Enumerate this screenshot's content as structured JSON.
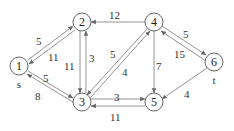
{
  "diagram": {
    "type": "directed-weighted-graph",
    "nodes": [
      {
        "id": "1",
        "label": "1",
        "sublabel": "s",
        "x": 19,
        "y": 66
      },
      {
        "id": "2",
        "label": "2",
        "x": 82,
        "y": 22
      },
      {
        "id": "3",
        "label": "3",
        "x": 82,
        "y": 102
      },
      {
        "id": "4",
        "label": "4",
        "x": 154,
        "y": 22
      },
      {
        "id": "5",
        "label": "5",
        "x": 154,
        "y": 102
      },
      {
        "id": "6",
        "label": "6",
        "sublabel": "t",
        "x": 214,
        "y": 62
      }
    ],
    "edges": [
      {
        "from": "1",
        "to": "2",
        "weight": "5"
      },
      {
        "from": "2",
        "to": "1",
        "weight": "11"
      },
      {
        "from": "1",
        "to": "3",
        "weight": "5"
      },
      {
        "from": "3",
        "to": "1",
        "weight": "8"
      },
      {
        "from": "2",
        "to": "3",
        "weight": "11"
      },
      {
        "from": "3",
        "to": "2",
        "weight": "3"
      },
      {
        "from": "4",
        "to": "2",
        "weight": "12"
      },
      {
        "from": "4",
        "to": "3",
        "weight": "5"
      },
      {
        "from": "3",
        "to": "4",
        "weight": "4"
      },
      {
        "from": "3",
        "to": "5",
        "weight": "3"
      },
      {
        "from": "5",
        "to": "3",
        "weight": "11"
      },
      {
        "from": "4",
        "to": "5",
        "weight": "7"
      },
      {
        "from": "4",
        "to": "6",
        "weight": "5"
      },
      {
        "from": "6",
        "to": "4",
        "weight": "15"
      },
      {
        "from": "6",
        "to": "5",
        "weight": "4"
      }
    ]
  }
}
